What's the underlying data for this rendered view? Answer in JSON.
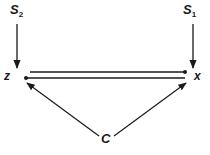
{
  "diagram": {
    "nodes": {
      "s2": {
        "label": "S",
        "subscript": "2"
      },
      "s1": {
        "label": "S",
        "subscript": "1"
      },
      "z": {
        "label": "z"
      },
      "x": {
        "label": "x"
      },
      "c": {
        "label": "C"
      }
    },
    "edges": [
      {
        "from": "S2",
        "to": "z",
        "style": "arrow"
      },
      {
        "from": "S1",
        "to": "x",
        "style": "arrow"
      },
      {
        "from": "z",
        "to": "x",
        "style": "dot-head"
      },
      {
        "from": "x",
        "to": "z",
        "style": "dot-head"
      },
      {
        "from": "C",
        "to": "z",
        "style": "arrow"
      },
      {
        "from": "C",
        "to": "x",
        "style": "arrow"
      }
    ],
    "colors": {
      "ink": "#1a1a1a",
      "background": "#ffffff"
    }
  }
}
